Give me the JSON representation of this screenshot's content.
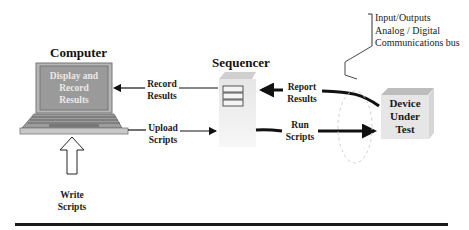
{
  "diagram": {
    "nodes": {
      "computer": {
        "title": "Computer",
        "screen_text": "Display and Record Results",
        "screen_lines": [
          "Display and",
          "Record",
          "Results"
        ]
      },
      "sequencer": {
        "title": "Sequencer"
      },
      "dut": {
        "lines": [
          "Device",
          "Under",
          "Test"
        ]
      },
      "io_note": {
        "lines": [
          "Input/Outputs",
          "Analog / Digital",
          "Communications bus"
        ]
      }
    },
    "edges": {
      "record_results": {
        "lines": [
          "Record",
          "Results"
        ],
        "from": "Sequencer",
        "to": "Computer"
      },
      "upload_scripts": {
        "lines": [
          "Upload",
          "Scripts"
        ],
        "from": "Computer",
        "to": "Sequencer"
      },
      "report_results": {
        "lines": [
          "Report",
          "Results"
        ],
        "from": "Device Under Test",
        "to": "Sequencer"
      },
      "run_scripts": {
        "lines": [
          "Run",
          "Scripts"
        ],
        "from": "Sequencer",
        "to": "Device Under Test"
      },
      "write_scripts": {
        "lines": [
          "Write",
          "Scripts"
        ],
        "to": "Computer"
      }
    },
    "colors": {
      "screen_fill": "#9a9a9a",
      "laptop_body": "#c8c8c8",
      "server_fill": "#ececec",
      "server_top": "#d4d4d4",
      "dut_fill": "#e6e6e6",
      "dut_top": "#bdbdbd",
      "arrow": "#111111"
    }
  }
}
